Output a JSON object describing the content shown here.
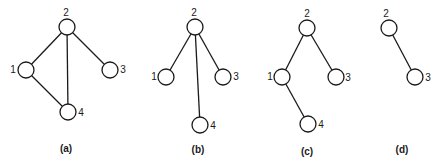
{
  "figure": {
    "node_radius": 8,
    "colors": {
      "stroke": "#1a1a1a",
      "background": "#ffffff"
    },
    "panels": [
      {
        "id": "a",
        "caption": "(a)",
        "caption_pos": [
          66,
          149
        ],
        "nodes": [
          {
            "id": "2",
            "label": "2",
            "x": 67,
            "y": 27,
            "label_x": 66,
            "label_y": 13
          },
          {
            "id": "1",
            "label": "1",
            "x": 26,
            "y": 70,
            "label_x": 13,
            "label_y": 70
          },
          {
            "id": "3",
            "label": "3",
            "x": 110,
            "y": 70,
            "label_x": 123,
            "label_y": 70
          },
          {
            "id": "4",
            "label": "4",
            "x": 68,
            "y": 112,
            "label_x": 81,
            "label_y": 113
          }
        ],
        "edges": [
          [
            "2",
            "1"
          ],
          [
            "2",
            "3"
          ],
          [
            "2",
            "4"
          ],
          [
            "1",
            "4"
          ]
        ]
      },
      {
        "id": "b",
        "caption": "(b)",
        "caption_pos": [
          198,
          150
        ],
        "nodes": [
          {
            "id": "2",
            "label": "2",
            "x": 195,
            "y": 27,
            "label_x": 194,
            "label_y": 13
          },
          {
            "id": "1",
            "label": "1",
            "x": 166,
            "y": 77,
            "label_x": 154,
            "label_y": 77
          },
          {
            "id": "3",
            "label": "3",
            "x": 223,
            "y": 77,
            "label_x": 236,
            "label_y": 77
          },
          {
            "id": "4",
            "label": "4",
            "x": 200,
            "y": 125,
            "label_x": 213,
            "label_y": 126
          }
        ],
        "edges": [
          [
            "2",
            "1"
          ],
          [
            "2",
            "3"
          ],
          [
            "2",
            "4"
          ]
        ]
      },
      {
        "id": "c",
        "caption": "(c)",
        "caption_pos": [
          307,
          152
        ],
        "nodes": [
          {
            "id": "2",
            "label": "2",
            "x": 307,
            "y": 28,
            "label_x": 307,
            "label_y": 14
          },
          {
            "id": "1",
            "label": "1",
            "x": 282,
            "y": 77,
            "label_x": 270,
            "label_y": 77
          },
          {
            "id": "3",
            "label": "3",
            "x": 336,
            "y": 77,
            "label_x": 348,
            "label_y": 78
          },
          {
            "id": "4",
            "label": "4",
            "x": 308,
            "y": 124,
            "label_x": 321,
            "label_y": 125
          }
        ],
        "edges": [
          [
            "2",
            "1"
          ],
          [
            "2",
            "3"
          ],
          [
            "1",
            "4"
          ]
        ]
      },
      {
        "id": "d",
        "caption": "(d)",
        "caption_pos": [
          402,
          150
        ],
        "nodes": [
          {
            "id": "2",
            "label": "2",
            "x": 389,
            "y": 28,
            "label_x": 386,
            "label_y": 14
          },
          {
            "id": "3",
            "label": "3",
            "x": 415,
            "y": 77,
            "label_x": 428,
            "label_y": 78
          }
        ],
        "edges": [
          [
            "2",
            "3"
          ]
        ]
      }
    ]
  }
}
